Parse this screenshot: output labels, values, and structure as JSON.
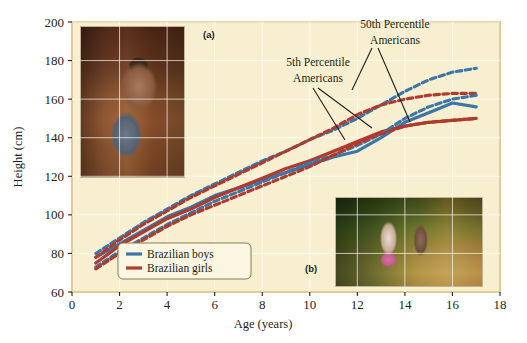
{
  "figure": {
    "panel_labels": [
      {
        "id": "a",
        "text": "(a)"
      },
      {
        "id": "b",
        "text": "(b)"
      }
    ],
    "photos": [
      {
        "name": "photo-boy-carrying-animal",
        "panel": "(a)"
      },
      {
        "name": "photo-two-girls-carrying-load",
        "panel": "(b)"
      }
    ],
    "background_color": "#f7efcf",
    "plot_border_color": "#e8d9a4"
  },
  "chart_data": {
    "type": "line",
    "title": "",
    "xlabel": "Age (years)",
    "ylabel": "Height (cm)",
    "xlim": [
      0,
      18
    ],
    "ylim": [
      60,
      200
    ],
    "xticks": [
      0,
      2,
      4,
      6,
      8,
      10,
      12,
      14,
      16,
      18
    ],
    "yticks": [
      60,
      80,
      100,
      120,
      140,
      160,
      180,
      200
    ],
    "grid": true,
    "legend_position": "bottom-left-inside",
    "series": [
      {
        "name": "Brazilian boys",
        "color": "#3a76a8",
        "style": "solid",
        "x": [
          1,
          2,
          3,
          4,
          5,
          6,
          7,
          8,
          9,
          10,
          11,
          12,
          13,
          14,
          15,
          16,
          17
        ],
        "values": [
          78,
          85,
          92,
          99,
          104,
          110,
          114,
          118,
          122,
          126,
          130,
          133,
          140,
          148,
          153,
          158,
          156
        ]
      },
      {
        "name": "Brazilian girls",
        "color": "#b03a2e",
        "style": "solid",
        "x": [
          1,
          2,
          3,
          4,
          5,
          6,
          7,
          8,
          9,
          10,
          11,
          12,
          13,
          14,
          15,
          16,
          17
        ],
        "values": [
          75,
          84,
          91,
          98,
          103,
          109,
          114,
          119,
          124,
          128,
          133,
          138,
          143,
          146,
          148,
          149,
          150
        ]
      },
      {
        "name": "50th Percentile Americans boys",
        "color": "#3a76a8",
        "style": "dashed",
        "x": [
          1,
          2,
          3,
          4,
          5,
          6,
          7,
          8,
          9,
          10,
          11,
          12,
          13,
          14,
          15,
          16,
          17
        ],
        "values": [
          80,
          88,
          96,
          103,
          110,
          116,
          122,
          128,
          133,
          139,
          144,
          150,
          157,
          164,
          170,
          174,
          176
        ]
      },
      {
        "name": "50th Percentile Americans girls",
        "color": "#b03a2e",
        "style": "dashed",
        "x": [
          1,
          2,
          3,
          4,
          5,
          6,
          7,
          8,
          9,
          10,
          11,
          12,
          13,
          14,
          15,
          16,
          17
        ],
        "values": [
          78,
          87,
          95,
          102,
          109,
          115,
          121,
          127,
          133,
          139,
          145,
          152,
          157,
          160,
          162,
          163,
          163
        ]
      },
      {
        "name": "5th Percentile Americans boys",
        "color": "#3a76a8",
        "style": "dashed",
        "x": [
          1,
          2,
          3,
          4,
          5,
          6,
          7,
          8,
          9,
          10,
          11,
          12,
          13,
          14,
          15,
          16,
          17
        ],
        "values": [
          73,
          81,
          88,
          95,
          101,
          107,
          112,
          117,
          122,
          127,
          131,
          136,
          142,
          150,
          156,
          160,
          162
        ]
      },
      {
        "name": "5th Percentile Americans girls",
        "color": "#b03a2e",
        "style": "dashed",
        "x": [
          1,
          2,
          3,
          4,
          5,
          6,
          7,
          8,
          9,
          10,
          11,
          12,
          13,
          14,
          15,
          16,
          17
        ],
        "values": [
          72,
          80,
          87,
          94,
          100,
          105,
          110,
          115,
          120,
          125,
          131,
          137,
          142,
          146,
          148,
          149,
          150
        ]
      }
    ],
    "annotations": [
      {
        "id": "annot-50th",
        "text_line1": "50th Percentile",
        "text_line2": "Americans",
        "text_x": 395,
        "text_y": 28,
        "leaders": [
          {
            "x1": 372,
            "y1": 48,
            "x2": 352,
            "y2": 90
          },
          {
            "x1": 378,
            "y1": 48,
            "x2": 410,
            "y2": 122
          }
        ]
      },
      {
        "id": "annot-5th",
        "text_line1": "5th Percentile",
        "text_line2": "Americans",
        "text_x": 318,
        "text_y": 66,
        "leaders": [
          {
            "x1": 313,
            "y1": 88,
            "x2": 345,
            "y2": 140
          },
          {
            "x1": 318,
            "y1": 88,
            "x2": 372,
            "y2": 128
          }
        ]
      }
    ],
    "legend": [
      {
        "label": "Brazilian boys",
        "color": "#3a76a8"
      },
      {
        "label": "Brazilian girls",
        "color": "#b03a2e"
      }
    ]
  }
}
